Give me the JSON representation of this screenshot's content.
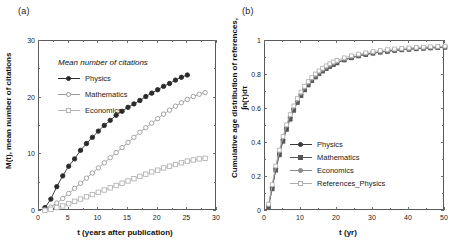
{
  "figure": {
    "panel_a_label": "(a)",
    "panel_b_label": "(b)"
  },
  "chart_data": [
    {
      "id": "panel-a",
      "type": "scatter",
      "title": "Mean number of citations",
      "xlabel": "t (years after publication)",
      "ylabel": "M(t), mean number of citations",
      "xlim": [
        0,
        30
      ],
      "ylim": [
        0,
        30
      ],
      "xticks": [
        0,
        5,
        10,
        15,
        20,
        25,
        30
      ],
      "yticks": [
        0,
        10,
        20,
        30
      ],
      "grid": false,
      "legend_position": "upper-left",
      "series": [
        {
          "name": "Physics",
          "marker": "filled-circle",
          "color": "#2b2b2b",
          "x": [
            1,
            2,
            3,
            4,
            5,
            6,
            7,
            8,
            9,
            10,
            11,
            12,
            13,
            14,
            15,
            16,
            17,
            18,
            19,
            20,
            21,
            22,
            23,
            24,
            25
          ],
          "y": [
            0.6,
            2.1,
            4.3,
            6.2,
            7.9,
            9.2,
            10.7,
            11.9,
            13.0,
            14.1,
            15.1,
            16.0,
            16.9,
            17.6,
            18.3,
            18.9,
            19.5,
            20.2,
            20.8,
            21.4,
            22.0,
            22.5,
            23.1,
            23.6,
            24.0
          ]
        },
        {
          "name": "Mathematics",
          "marker": "open-circle",
          "color": "#9a9a9a",
          "x": [
            1,
            2,
            3,
            4,
            5,
            6,
            7,
            8,
            9,
            10,
            11,
            12,
            13,
            14,
            15,
            16,
            17,
            18,
            19,
            20,
            21,
            22,
            23,
            24,
            25,
            26,
            27,
            28
          ],
          "y": [
            0.2,
            0.7,
            1.4,
            2.2,
            3.1,
            4.0,
            4.9,
            5.8,
            6.7,
            7.6,
            8.5,
            9.4,
            10.3,
            11.2,
            12.1,
            13.0,
            13.9,
            14.7,
            15.5,
            16.3,
            17.1,
            17.8,
            18.5,
            19.1,
            19.7,
            20.2,
            20.6,
            20.9
          ]
        },
        {
          "name": "Economics",
          "marker": "open-square",
          "color": "#b4b4b4",
          "x": [
            1,
            2,
            3,
            4,
            5,
            6,
            7,
            8,
            9,
            10,
            11,
            12,
            13,
            14,
            15,
            16,
            17,
            18,
            19,
            20,
            21,
            22,
            23,
            24,
            25,
            26,
            27,
            28
          ],
          "y": [
            0.1,
            0.3,
            0.6,
            0.9,
            1.3,
            1.7,
            2.1,
            2.5,
            2.9,
            3.3,
            3.7,
            4.1,
            4.5,
            4.9,
            5.3,
            5.7,
            6.1,
            6.5,
            6.9,
            7.2,
            7.6,
            7.9,
            8.2,
            8.5,
            8.8,
            9.0,
            9.2,
            9.3
          ]
        }
      ]
    },
    {
      "id": "panel-b",
      "type": "line",
      "title": "",
      "xlabel": "t (yr)",
      "ylabel_line1": "Cumulative age distribution of references,",
      "ylabel_line2": "∫n(τ)dτ",
      "xlim": [
        0,
        50
      ],
      "ylim": [
        0,
        1
      ],
      "xticks": [
        0,
        10,
        20,
        30,
        40,
        50
      ],
      "yticks": [
        "0",
        "0.2",
        "0.4",
        "0.6",
        "0.8",
        "1"
      ],
      "grid": false,
      "legend_position": "lower-right",
      "series": [
        {
          "name": "Physics",
          "marker": "filled-circle",
          "color": "#3a3a3a",
          "x": [
            1,
            2,
            3,
            4,
            5,
            6,
            7,
            8,
            9,
            10,
            11,
            12,
            13,
            14,
            15,
            16,
            17,
            18,
            19,
            20,
            22,
            24,
            26,
            28,
            30,
            32,
            34,
            36,
            38,
            40,
            42,
            44,
            46,
            48,
            50
          ],
          "y": [
            0.03,
            0.14,
            0.25,
            0.34,
            0.42,
            0.49,
            0.55,
            0.6,
            0.645,
            0.685,
            0.718,
            0.746,
            0.77,
            0.791,
            0.81,
            0.826,
            0.84,
            0.852,
            0.863,
            0.873,
            0.889,
            0.902,
            0.913,
            0.921,
            0.929,
            0.935,
            0.94,
            0.945,
            0.949,
            0.952,
            0.955,
            0.958,
            0.96,
            0.962,
            0.964
          ]
        },
        {
          "name": "Mathematics",
          "marker": "filled-square",
          "color": "#555555",
          "x": [
            1,
            2,
            3,
            4,
            5,
            6,
            7,
            8,
            9,
            10,
            11,
            12,
            13,
            14,
            15,
            16,
            17,
            18,
            19,
            20,
            22,
            24,
            26,
            28,
            30,
            32,
            34,
            36,
            38,
            40,
            42,
            44,
            46,
            48,
            50
          ],
          "y": [
            0.025,
            0.13,
            0.24,
            0.33,
            0.41,
            0.48,
            0.54,
            0.592,
            0.638,
            0.678,
            0.712,
            0.741,
            0.766,
            0.788,
            0.807,
            0.823,
            0.837,
            0.85,
            0.861,
            0.871,
            0.888,
            0.901,
            0.912,
            0.92,
            0.928,
            0.934,
            0.939,
            0.944,
            0.948,
            0.951,
            0.954,
            0.957,
            0.959,
            0.961,
            0.963
          ]
        },
        {
          "name": "Economics",
          "marker": "filled-circle-small",
          "color": "#8a8a8a",
          "x": [
            1,
            2,
            3,
            4,
            5,
            6,
            7,
            8,
            9,
            10,
            11,
            12,
            13,
            14,
            15,
            16,
            17,
            18,
            19,
            20,
            22,
            24,
            26,
            28,
            30,
            32,
            34,
            36,
            38,
            40,
            42,
            44,
            46,
            48,
            50
          ],
          "y": [
            0.035,
            0.15,
            0.26,
            0.35,
            0.43,
            0.5,
            0.56,
            0.61,
            0.652,
            0.69,
            0.723,
            0.751,
            0.775,
            0.795,
            0.813,
            0.829,
            0.843,
            0.855,
            0.866,
            0.876,
            0.891,
            0.904,
            0.914,
            0.923,
            0.93,
            0.936,
            0.941,
            0.946,
            0.95,
            0.953,
            0.956,
            0.959,
            0.961,
            0.963,
            0.965
          ]
        },
        {
          "name": "References_Physics",
          "marker": "open-square",
          "color": "#adadad",
          "x": [
            1,
            2,
            3,
            4,
            5,
            6,
            7,
            8,
            9,
            10,
            11,
            12,
            13,
            14,
            15,
            16,
            17,
            18,
            19,
            20,
            22,
            24,
            26,
            28,
            30,
            32,
            34,
            36,
            38,
            40,
            42,
            44,
            46,
            48,
            50
          ],
          "y": [
            0.04,
            0.155,
            0.265,
            0.358,
            0.438,
            0.507,
            0.567,
            0.618,
            0.661,
            0.7,
            0.733,
            0.761,
            0.785,
            0.806,
            0.824,
            0.84,
            0.854,
            0.866,
            0.877,
            0.886,
            0.901,
            0.913,
            0.923,
            0.931,
            0.938,
            0.944,
            0.949,
            0.953,
            0.956,
            0.959,
            0.962,
            0.964,
            0.966,
            0.968,
            0.97
          ]
        }
      ]
    }
  ]
}
